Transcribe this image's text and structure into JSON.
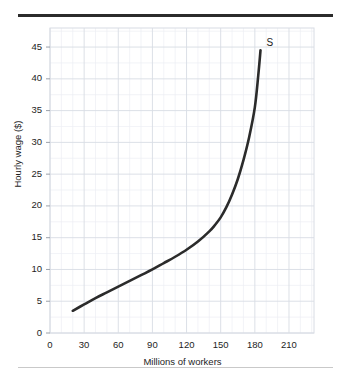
{
  "figure": {
    "top_rule": "horizontal-rule",
    "bottom_rule": "horizontal-rule"
  },
  "chart_data": {
    "type": "line",
    "title": "",
    "xlabel": "Millions of workers",
    "ylabel": "Hourly wage ($)",
    "xlim": [
      0,
      232
    ],
    "ylim": [
      0,
      48
    ],
    "xticks": [
      "0",
      "30",
      "60",
      "90",
      "120",
      "150",
      "180",
      "210"
    ],
    "xtick_values": [
      0,
      30,
      60,
      90,
      120,
      150,
      180,
      210
    ],
    "yticks": [
      "0",
      "5",
      "10",
      "15",
      "20",
      "25",
      "30",
      "35",
      "40",
      "45"
    ],
    "ytick_values": [
      0,
      5,
      10,
      15,
      20,
      25,
      30,
      35,
      40,
      45
    ],
    "grid": true,
    "grid_minor": true,
    "grid_color": "#d8dce4",
    "grid_minor_color": "#eceef3",
    "legend": "none",
    "series": [
      {
        "name": "S",
        "label": "S",
        "label_x": 185,
        "label_y": 45.5,
        "color": "#2b2b2b",
        "linewidth": 2.6,
        "x": [
          20,
          30,
          40,
          50,
          60,
          70,
          80,
          90,
          100,
          110,
          120,
          130,
          140,
          145,
          150,
          155,
          160,
          165,
          170,
          175,
          180,
          183,
          185
        ],
        "y": [
          3.5,
          4.5,
          5.5,
          6.4,
          7.3,
          8.2,
          9.1,
          10.0,
          11.0,
          12.0,
          13.1,
          14.4,
          16.0,
          17.0,
          18.2,
          19.8,
          21.8,
          24.2,
          27.2,
          30.8,
          35.5,
          40.5,
          44.5
        ]
      }
    ],
    "annotations": [
      {
        "text": "S",
        "x": 185,
        "y": 45.5,
        "name": "supply-curve-label"
      }
    ]
  }
}
